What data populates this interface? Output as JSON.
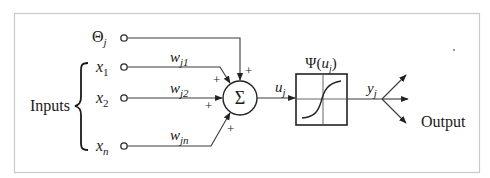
{
  "diagram": {
    "inputs_group_label": "Inputs",
    "bias": {
      "symbol": "Θ",
      "subscript": "j"
    },
    "inputs": [
      {
        "symbol": "x",
        "subscript": "1",
        "weight": {
          "symbol": "w",
          "subscript": "j1"
        },
        "sign": "+"
      },
      {
        "symbol": "x",
        "subscript": "2",
        "weight": {
          "symbol": "w",
          "subscript": "j2"
        },
        "sign": "+"
      },
      {
        "symbol": "x",
        "subscript": "n",
        "weight": {
          "symbol": "w",
          "subscript": "jn"
        },
        "sign": "+"
      }
    ],
    "bias_sign": "+",
    "summation": {
      "symbol": "Σ"
    },
    "net_input": {
      "symbol": "u",
      "subscript": "j"
    },
    "activation": {
      "label_prefix": "Ψ(",
      "arg_symbol": "u",
      "arg_subscript": "j",
      "label_suffix": ")",
      "shape": "sigmoid"
    },
    "output_signal": {
      "symbol": "y",
      "subscript": "j"
    },
    "output_label": "Output",
    "output_branches": 3,
    "colors": {
      "line": "#222222",
      "frame": "#c9c9c9",
      "background": "#ffffff"
    }
  }
}
